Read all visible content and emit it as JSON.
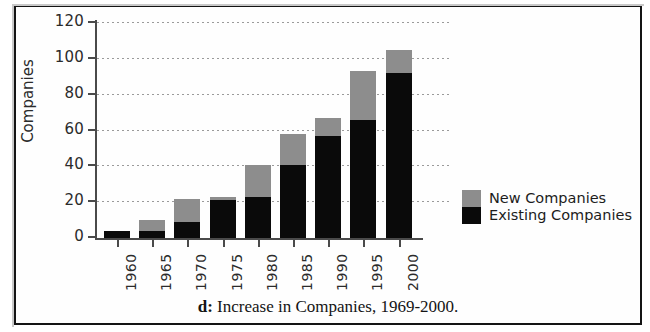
{
  "figure": {
    "caption_prefix": "d:",
    "caption_text": " Increase in Companies, 1969-2000."
  },
  "legend": {
    "position": "right",
    "items": [
      {
        "label": "New Companies",
        "color": "#8d8d8d",
        "key": "new"
      },
      {
        "label": "Existing Companies",
        "color": "#0a0a0a",
        "key": "existing"
      }
    ]
  },
  "axes": {
    "y_title": "Companies",
    "y_ticks": [
      "0",
      "20",
      "40",
      "60",
      "80",
      "100",
      "120"
    ],
    "x_ticks": [
      "1960",
      "1965",
      "1970",
      "1975",
      "1980",
      "1985",
      "1990",
      "1995",
      "2000"
    ]
  },
  "chart_data": {
    "type": "bar",
    "stacked": true,
    "title": "d: Increase in Companies, 1969-2000.",
    "xlabel": "",
    "ylabel": "Companies",
    "ylim": [
      0,
      120
    ],
    "ytick_values": [
      0,
      20,
      40,
      60,
      80,
      100,
      120
    ],
    "grid": true,
    "grid_axis": "y",
    "legend_position": "right",
    "categories": [
      "1960",
      "1965",
      "1970",
      "1975",
      "1980",
      "1985",
      "1990",
      "1995",
      "2000"
    ],
    "series": [
      {
        "name": "Existing Companies",
        "color": "#0a0a0a",
        "values": [
          4,
          4,
          9,
          21,
          23,
          41,
          57,
          66,
          92
        ]
      },
      {
        "name": "New Companies",
        "color": "#8d8d8d",
        "values": [
          0,
          6,
          13,
          2,
          18,
          17,
          10,
          27,
          13
        ]
      }
    ],
    "totals": [
      4,
      10,
      22,
      23,
      41,
      58,
      67,
      93,
      105
    ]
  }
}
